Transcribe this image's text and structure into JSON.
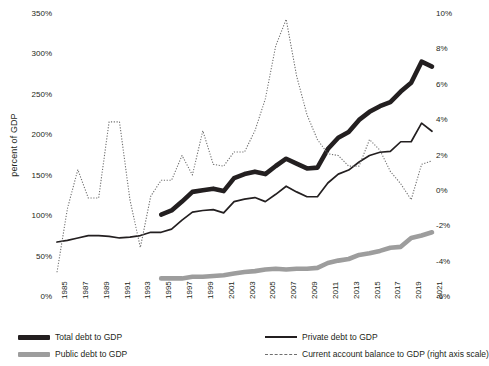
{
  "chart_data": {
    "type": "line",
    "title": "",
    "xlabel": "",
    "ylabel": "percent of GDP",
    "ylabel_right": "",
    "grid": false,
    "legend_position": "bottom",
    "x": [
      1985,
      1986,
      1987,
      1988,
      1989,
      1990,
      1991,
      1992,
      1993,
      1994,
      1995,
      1996,
      1997,
      1998,
      1999,
      2000,
      2001,
      2002,
      2003,
      2004,
      2005,
      2006,
      2007,
      2008,
      2009,
      2010,
      2011,
      2012,
      2013,
      2014,
      2015,
      2016,
      2017,
      2018,
      2019,
      2020,
      2021
    ],
    "xtick_labels": [
      "1985",
      "1987",
      "1989",
      "1991",
      "1993",
      "1995",
      "1997",
      "1999",
      "2001",
      "2003",
      "2005",
      "2007",
      "2009",
      "2011",
      "2013",
      "2015",
      "2017",
      "2019",
      "2021"
    ],
    "xtick_values": [
      1985,
      1987,
      1989,
      1991,
      1993,
      1995,
      1997,
      1999,
      2001,
      2003,
      2005,
      2007,
      2009,
      2011,
      2013,
      2015,
      2017,
      2019,
      2021
    ],
    "ylim": [
      0,
      350
    ],
    "ytick_labels": [
      "0%",
      "50%",
      "100%",
      "150%",
      "200%",
      "250%",
      "300%",
      "350%"
    ],
    "ytick_values": [
      0,
      50,
      100,
      150,
      200,
      250,
      300,
      350
    ],
    "ylim_right": [
      -6,
      10
    ],
    "ytick_labels_right": [
      "-6%",
      "-4%",
      "-2%",
      "0%",
      "2%",
      "4%",
      "6%",
      "8%",
      "10%"
    ],
    "ytick_values_right": [
      -6,
      -4,
      -2,
      0,
      2,
      4,
      6,
      8,
      10
    ],
    "series": [
      {
        "name": "Total debt to GDP",
        "key": "total_debt",
        "axis": "left",
        "color": "#231f20",
        "style": "solid",
        "width": 4.6,
        "x": [
          1995,
          1996,
          1997,
          1998,
          1999,
          2000,
          2001,
          2002,
          2003,
          2004,
          2005,
          2006,
          2007,
          2008,
          2009,
          2010,
          2011,
          2012,
          2013,
          2014,
          2015,
          2016,
          2017,
          2018,
          2019,
          2020,
          2021
        ],
        "values": [
          102,
          107,
          118,
          130,
          132,
          134,
          131,
          147,
          152,
          155,
          152,
          162,
          171,
          165,
          159,
          160,
          183,
          197,
          204,
          219,
          229,
          236,
          241,
          254,
          265,
          291,
          285
        ]
      },
      {
        "name": "Private debt to GDP",
        "key": "private_debt",
        "axis": "left",
        "color": "#231f20",
        "style": "solid",
        "width": 1.7,
        "x": [
          1985,
          1986,
          1987,
          1988,
          1989,
          1990,
          1991,
          1992,
          1993,
          1994,
          1995,
          1996,
          1997,
          1998,
          1999,
          2000,
          2001,
          2002,
          2003,
          2004,
          2005,
          2006,
          2007,
          2008,
          2009,
          2010,
          2011,
          2012,
          2013,
          2014,
          2015,
          2016,
          2017,
          2018,
          2019,
          2020,
          2021
        ],
        "values": [
          68,
          70,
          73,
          76,
          76,
          75,
          73,
          74,
          76,
          80,
          80,
          84,
          95,
          105,
          107,
          108,
          104,
          118,
          121,
          123,
          118,
          127,
          137,
          130,
          124,
          124,
          141,
          152,
          157,
          167,
          175,
          179,
          180,
          192,
          192,
          215,
          205
        ]
      },
      {
        "name": "Public debt to GDP",
        "key": "public_debt",
        "axis": "left",
        "color": "#9d9d9d",
        "style": "solid",
        "width": 4.6,
        "x": [
          1995,
          1996,
          1997,
          1998,
          1999,
          2000,
          2001,
          2002,
          2003,
          2004,
          2005,
          2006,
          2007,
          2008,
          2009,
          2010,
          2011,
          2012,
          2013,
          2014,
          2015,
          2016,
          2017,
          2018,
          2019,
          2020,
          2021
        ],
        "values": [
          23,
          23,
          23,
          25,
          25,
          26,
          27,
          29,
          31,
          32,
          34,
          35,
          34,
          35,
          35,
          36,
          42,
          45,
          47,
          52,
          54,
          57,
          61,
          62,
          73,
          76,
          80
        ]
      },
      {
        "name": "Current account balance to GDP (right axis scale)",
        "key": "current_account",
        "axis": "right",
        "color": "#6f6f6f",
        "style": "dotted",
        "width": 1.1,
        "x": [
          1985,
          1986,
          1987,
          1988,
          1989,
          1990,
          1991,
          1992,
          1993,
          1994,
          1995,
          1996,
          1997,
          1998,
          1999,
          2000,
          2001,
          2002,
          2003,
          2004,
          2005,
          2006,
          2007,
          2008,
          2009,
          2010,
          2011,
          2012,
          2013,
          2014,
          2015,
          2016,
          2017,
          2018,
          2019,
          2020,
          2021
        ],
        "values": [
          -4.6,
          -1.0,
          1.2,
          -0.4,
          -0.4,
          3.9,
          3.9,
          -0.5,
          -3.2,
          -0.3,
          0.6,
          0.6,
          2.0,
          0.9,
          3.4,
          1.5,
          1.4,
          2.2,
          2.2,
          3.4,
          5.2,
          8.2,
          9.7,
          6.5,
          4.3,
          2.9,
          2.1,
          2.0,
          1.4,
          1.4,
          2.9,
          2.3,
          1.1,
          0.4,
          -0.5,
          1.5,
          1.7
        ]
      }
    ]
  },
  "legend": {
    "items": [
      {
        "label": "Total debt to GDP",
        "swatch": "swatch-thick-black"
      },
      {
        "label": "Private debt to GDP",
        "swatch": "swatch-thin-black"
      },
      {
        "label": "Public debt to GDP",
        "swatch": "swatch-thick-gray"
      },
      {
        "label": "Current account balance to GDP (right axis scale)",
        "swatch": "swatch-dotted"
      }
    ]
  },
  "colors": {
    "total_debt": "#231f20",
    "private_debt": "#231f20",
    "public_debt": "#9d9d9d",
    "current_account": "#6f6f6f",
    "background": "#ffffff",
    "text": "#231f20"
  }
}
